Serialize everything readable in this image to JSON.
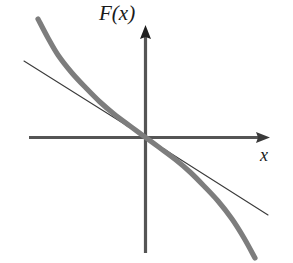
{
  "figure": {
    "title": "",
    "background_color": "#ffffff",
    "width": 293,
    "height": 263,
    "y_axis_label": "F(x)",
    "x_axis_label": "x"
  },
  "axes": {
    "axis_color": "#555555",
    "origin": {
      "x": 145,
      "y": 137
    },
    "x_axis": {
      "start_x": 29,
      "end_x": 270,
      "y": 137,
      "arrow": "right-arrowhead"
    },
    "y_axis": {
      "x": 145,
      "start_y": 253,
      "end_y": 25,
      "arrow": "up-arrowhead"
    }
  },
  "chart_data": {
    "type": "line",
    "title": "",
    "xlabel": "x",
    "ylabel": "F(x)",
    "grid": false,
    "legend": null,
    "axis_style": "cartesian-arrows-through-origin",
    "xlim": [
      -1.45,
      1.45
    ],
    "ylim": [
      -1.4,
      1.4
    ],
    "series": [
      {
        "name": "F(x) nonlinear curve",
        "style": "thick-gray-curve",
        "color": "#7d7d7d",
        "width_px": 5.2,
        "description": "Monotonically decreasing S-shaped (odd, cubic-like) curve passing through the origin with negative slope, steepening at both ends",
        "x": [
          -1.05,
          -0.95,
          -0.85,
          -0.72,
          -0.6,
          -0.45,
          -0.3,
          -0.15,
          0.0,
          0.15,
          0.3,
          0.45,
          0.6,
          0.72,
          0.85,
          0.95,
          1.05
        ],
        "y": [
          1.3,
          1.1,
          0.92,
          0.74,
          0.6,
          0.44,
          0.29,
          0.145,
          0.0,
          -0.145,
          -0.29,
          -0.44,
          -0.6,
          -0.74,
          -0.92,
          -1.1,
          -1.3
        ],
        "points_px": [
          [
            38,
            19
          ],
          [
            48,
            38
          ],
          [
            58,
            55
          ],
          [
            72,
            73
          ],
          [
            86,
            88
          ],
          [
            100,
            102
          ],
          [
            114,
            114
          ],
          [
            130,
            126
          ],
          [
            145,
            137
          ],
          [
            160,
            148
          ],
          [
            176,
            160
          ],
          [
            190,
            172
          ],
          [
            204,
            186
          ],
          [
            218,
            201
          ],
          [
            232,
            219
          ],
          [
            244,
            238
          ],
          [
            255,
            258
          ]
        ]
      },
      {
        "name": "linear approximation (tangent at origin)",
        "style": "thin-black-line",
        "color": "#3a3a3a",
        "width_px": 1.1,
        "description": "Straight line through the origin with the same negative slope as the curve at x = 0; tangent / linearization",
        "x": [
          -1.0,
          0.0,
          1.0
        ],
        "y": [
          0.62,
          0.0,
          -0.62
        ],
        "points_px": [
          [
            24,
            61
          ],
          [
            145,
            137
          ],
          [
            268,
            215
          ]
        ]
      }
    ]
  }
}
